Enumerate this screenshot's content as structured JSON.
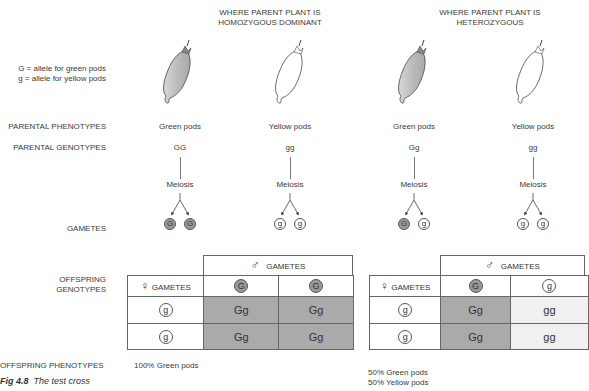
{
  "headers": {
    "homozygous": [
      "WHERE PARENT PLANT IS",
      "HOMOZYGOUS DOMINANT"
    ],
    "heterozygous": [
      "WHERE PARENT PLANT IS",
      "HETEROZYGOUS"
    ]
  },
  "legend": {
    "G": "G = allele for green pods",
    "g": "g = allele for yellow pods"
  },
  "row_labels": {
    "parental_phenotypes": "PARENTAL PHENOTYPES",
    "parental_genotypes": "PARENTAL GENOTYPES",
    "gametes": "GAMETES",
    "offspring_genotypes": [
      "OFFSPRING",
      "GENOTYPES"
    ],
    "offspring_phenotypes": "OFFSPRING PHENOTYPES"
  },
  "parents": [
    {
      "phenotype": "Green pods",
      "genotype": "GG",
      "process": "Meiosis",
      "gametes": [
        "G",
        "G"
      ],
      "color": "green"
    },
    {
      "phenotype": "Yellow pods",
      "genotype": "gg",
      "process": "Meiosis",
      "gametes": [
        "g",
        "g"
      ],
      "color": "yellow"
    },
    {
      "phenotype": "Green pods",
      "genotype": "Gg",
      "process": "Meiosis",
      "gametes": [
        "G",
        "g"
      ],
      "color": "green"
    },
    {
      "phenotype": "Yellow pods",
      "genotype": "gg",
      "process": "Meiosis",
      "gametes": [
        "g",
        "g"
      ],
      "color": "yellow"
    }
  ],
  "punnett": [
    {
      "male_header": "GAMETES",
      "female_header": "GAMETES",
      "male_gametes": [
        "G",
        "G"
      ],
      "female_gametes": [
        "g",
        "g"
      ],
      "cells": [
        [
          "Gg",
          "Gg"
        ],
        [
          "Gg",
          "Gg"
        ]
      ]
    },
    {
      "male_header": "GAMETES",
      "female_header": "GAMETES",
      "male_gametes": [
        "G",
        "g"
      ],
      "female_gametes": [
        "g",
        "g"
      ],
      "cells": [
        [
          "Gg",
          "gg"
        ],
        [
          "Gg",
          "gg"
        ]
      ]
    }
  ],
  "offspring_phenotypes": {
    "homozygous": "100% Green pods",
    "heterozygous": [
      "50% Green pods",
      "50% Yellow pods"
    ]
  },
  "caption": {
    "fig": "Fig 4.8",
    "title": "The test cross"
  },
  "symbols": {
    "male": "♂",
    "female": "♀"
  },
  "colors": {
    "dominant_fill": "#aaaaaa",
    "recessive_fill": "#f0f0f0",
    "line": "#666666"
  }
}
